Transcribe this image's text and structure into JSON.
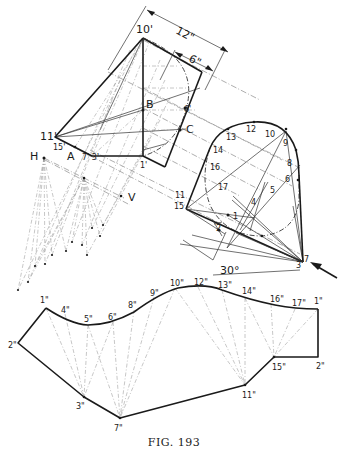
{
  "figure": {
    "caption": "FIG. 193",
    "dimensions": {
      "overall": "12\"",
      "partial": "6\""
    },
    "angle": "30°",
    "view_labels": {
      "horizontal": "H",
      "vertical": "V"
    },
    "upper_view_labels": {
      "p10p": "10'",
      "p11p": "11'",
      "p15p": "15'",
      "A": "A",
      "p7p3p": "7' 3'",
      "p1p": "1'",
      "B": "B",
      "C": "C",
      "p6p": "6'"
    },
    "circle_labels": {
      "p1": "1",
      "p2": "2",
      "p3": "3",
      "p4": "4",
      "p5": "5",
      "p6": "6",
      "p7": "7",
      "p8": "8",
      "p9": "9",
      "p10": "10",
      "p11": "11",
      "p12": "12",
      "p13": "13",
      "p14": "14",
      "p15": "15",
      "p16": "16",
      "p17": "17"
    },
    "development_labels": {
      "d1a": "1\"",
      "d2a": "2\"",
      "d3": "3\"",
      "d4": "4\"",
      "d5": "5\"",
      "d6": "6\"",
      "d7": "7\"",
      "d8": "8\"",
      "d9": "9\"",
      "d10": "10\"",
      "d11": "11\"",
      "d12": "12\"",
      "d13": "13\"",
      "d14": "14\"",
      "d15": "15\"",
      "d16": "16\"",
      "d17": "17\"",
      "d1b": "1\"",
      "d2b": "2\""
    }
  }
}
